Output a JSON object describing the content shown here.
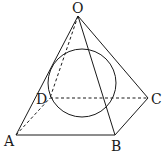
{
  "diagram": {
    "type": "pyramid-with-inscribed-sphere",
    "vertices": {
      "apex": "O",
      "base": [
        "A",
        "B",
        "C",
        "D"
      ]
    },
    "labels": {
      "O": "O",
      "A": "A",
      "B": "B",
      "C": "C",
      "D": "D"
    },
    "visible_edges": [
      "OA",
      "OB",
      "OC",
      "AB",
      "BC"
    ],
    "hidden_edges": [
      "OD",
      "AD",
      "DC"
    ],
    "inscribed_shape": "sphere",
    "colors": {
      "stroke": "#1a1a1a",
      "background": "#ffffff"
    }
  }
}
